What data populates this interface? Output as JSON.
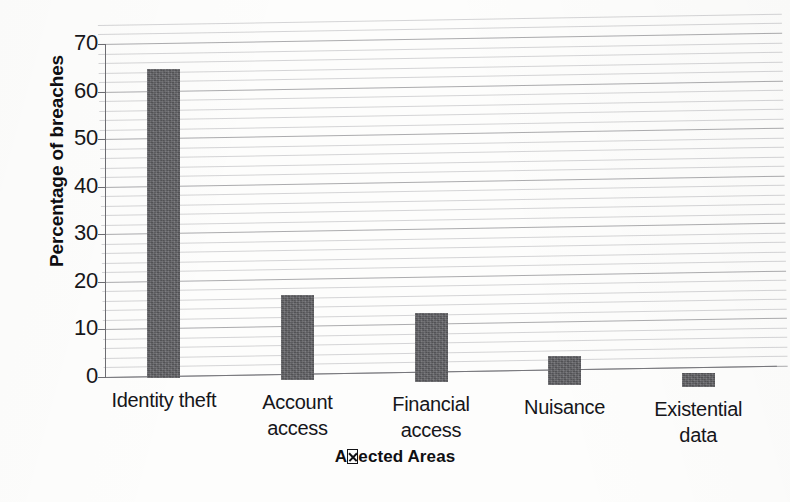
{
  "chart_data": {
    "type": "bar",
    "title": "",
    "subtitle": "",
    "xlabel": "Affected Areas",
    "xlabel_rendered": "A⌧ected Areas",
    "xlabel_note": "missing-glyph box replaces the 'ff' ligature in 'Affected'",
    "ylabel": "Percentage of breaches",
    "categories": [
      "Identity theft",
      "Account access",
      "Financial access",
      "Nuisance",
      "Existential data"
    ],
    "category_lines": [
      [
        "Identity theft"
      ],
      [
        "Account",
        "access"
      ],
      [
        "Financial",
        "access"
      ],
      [
        "Nuisance"
      ],
      [
        "Existential",
        "data"
      ]
    ],
    "values": [
      65,
      18,
      14.5,
      6,
      3
    ],
    "ylim": [
      0,
      70
    ],
    "ytick_values": [
      70,
      60,
      50,
      40,
      30,
      20,
      10,
      0
    ],
    "ytick_labels": [
      "70",
      "60",
      "50",
      "40",
      "30",
      "20",
      "10",
      "0"
    ],
    "ytick_interval": 10,
    "minor_gridline_interval": 2,
    "grid": true,
    "grid_axis": "y",
    "legend": false,
    "legend_position": "none",
    "bar_color": "#5e5e62",
    "gridline_color": "#78787e",
    "axis_color": "#6d6d72",
    "text_color": "#16161a",
    "background_color": "#fdfdfc",
    "bar_width_px": 33,
    "series": [
      {
        "name": "Percentage of breaches",
        "values": [
          65,
          18,
          14.5,
          6,
          3
        ]
      }
    ]
  },
  "figure": {
    "width": 790,
    "height": 502,
    "source_type": "scanned-page",
    "skew_degrees": -0.95
  }
}
